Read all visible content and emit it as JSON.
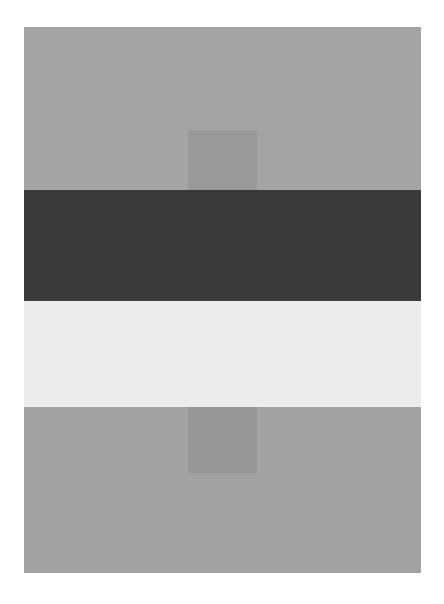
{
  "figure": {
    "bands": [
      {
        "name": "top-gray-band",
        "color": "#a4a4a4",
        "top": 0,
        "height": 163
      },
      {
        "name": "dark-band",
        "color": "#3a3a3a",
        "top": 163,
        "height": 111
      },
      {
        "name": "light-band",
        "color": "#ececec",
        "top": 274,
        "height": 106
      },
      {
        "name": "bottom-gray-band",
        "color": "#a2a2a2",
        "top": 380,
        "height": 166
      }
    ],
    "squares": [
      {
        "name": "upper-square",
        "color": "#999999",
        "top": 103,
        "height": 60
      },
      {
        "name": "lower-square",
        "color": "#979797",
        "top": 380,
        "height": 66
      }
    ]
  }
}
